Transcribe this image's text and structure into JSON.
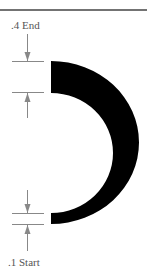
{
  "diagram": {
    "labels": {
      "end": ".4 End",
      "start": ".1 Start"
    },
    "colors": {
      "arc_fill": "#000000",
      "dimension_lines": "#888888",
      "top_rule": "#444444",
      "label_text": "#555555",
      "background": "#ffffff"
    },
    "shape": {
      "type": "tapered-arc",
      "description": "Half-ring arc opening left, thick at top end and thin at bottom start",
      "end_thickness_rel": 0.4,
      "start_thickness_rel": 0.1
    },
    "dimensions": [
      {
        "name": "end-thickness",
        "label_ref": "end",
        "position": "top"
      },
      {
        "name": "start-thickness",
        "label_ref": "start",
        "position": "bottom"
      }
    ]
  }
}
